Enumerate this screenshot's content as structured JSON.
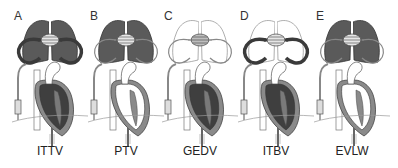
{
  "figure": {
    "panels": [
      {
        "letter": "A",
        "caption": "ITTV",
        "fills": {
          "lungs": "#5a5a5a",
          "vessels": "#3a3a3a",
          "heart": "#3f3f3f",
          "heart_wall": "#8a8a8a",
          "ascending": "#ffffff",
          "inner_lv": "#7a7a7a",
          "center": "#e6e6e6",
          "lung_stroke": "#333"
        }
      },
      {
        "letter": "B",
        "caption": "PTV",
        "fills": {
          "lungs": "#5a5a5a",
          "vessels": "#ffffff",
          "heart": "#ffffff",
          "heart_wall": "#8a8a8a",
          "ascending": "#ffffff",
          "inner_lv": "#8a8a8a",
          "center": "#e6e6e6",
          "lung_stroke": "#333"
        }
      },
      {
        "letter": "C",
        "caption": "GEDV",
        "fills": {
          "lungs": "#ffffff",
          "vessels": "#ffffff",
          "heart": "#3f3f3f",
          "heart_wall": "#8a8a8a",
          "ascending": "#ffffff",
          "inner_lv": "#7a7a7a",
          "center": "#bdbdbd",
          "lung_stroke": "#999"
        }
      },
      {
        "letter": "D",
        "caption": "ITBV",
        "fills": {
          "lungs": "#ffffff",
          "vessels": "#3a3a3a",
          "heart": "#3f3f3f",
          "heart_wall": "#8a8a8a",
          "ascending": "#ffffff",
          "inner_lv": "#7a7a7a",
          "center": "#e6e6e6",
          "lung_stroke": "#999"
        }
      },
      {
        "letter": "E",
        "caption": "EVLW",
        "fills": {
          "lungs": "#5a5a5a",
          "vessels": "#ffffff",
          "heart": "#ffffff",
          "heart_wall": "#8a8a8a",
          "ascending": "#ffffff",
          "inner_lv": "#8a8a8a",
          "center": "#e6e6e6",
          "lung_stroke": "#333"
        }
      }
    ],
    "panel_x": [
      10,
      86,
      160,
      236,
      312
    ]
  }
}
